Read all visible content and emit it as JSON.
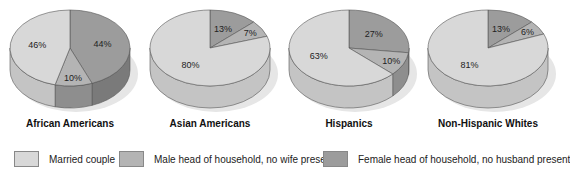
{
  "chart_data": [
    {
      "type": "pie",
      "title": "African Americans",
      "categories": [
        "Married couple",
        "Male head of household, no wife present",
        "Female head of household, no husband present"
      ],
      "values": [
        46,
        10,
        44
      ],
      "labels": [
        "46%",
        "10%",
        "44%"
      ]
    },
    {
      "type": "pie",
      "title": "Asian Americans",
      "categories": [
        "Married couple",
        "Male head of household, no wife present",
        "Female head of household, no husband present"
      ],
      "values": [
        80,
        7,
        13
      ],
      "labels": [
        "80%",
        "7%",
        "13%"
      ]
    },
    {
      "type": "pie",
      "title": "Hispanics",
      "categories": [
        "Married couple",
        "Male head of household, no wife present",
        "Female head of household, no husband present"
      ],
      "values": [
        63,
        10,
        27
      ],
      "labels": [
        "63%",
        "10%",
        "27%"
      ]
    },
    {
      "type": "pie",
      "title": "Non-Hispanic Whites",
      "categories": [
        "Married couple",
        "Male head of household, no wife present",
        "Female head of household, no husband present"
      ],
      "values": [
        81,
        6,
        13
      ],
      "labels": [
        "81%",
        "6%",
        "13%"
      ]
    }
  ],
  "legend": {
    "items": [
      {
        "label": "Married couple",
        "color": "#d8d8d8"
      },
      {
        "label": "Male head of household, no wife present",
        "color": "#b4b4b4"
      },
      {
        "label": "Female head of household, no husband present",
        "color": "#9c9c9c"
      }
    ]
  },
  "colors": {
    "married": "#d8d8d8",
    "married_side": "#c4c4c4",
    "male": "#b4b4b4",
    "male_side": "#8e8e8e",
    "female": "#9c9c9c",
    "female_side": "#7a7a7a",
    "shadow": "#e6e6e6"
  }
}
